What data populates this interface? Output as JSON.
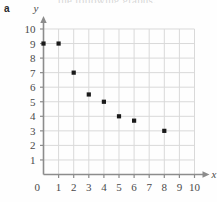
{
  "figure": {
    "part_label": "a",
    "clipped_heading": "the following graphs."
  },
  "chart_data": {
    "type": "scatter",
    "title": "",
    "xlabel": "x",
    "ylabel": "y",
    "xlim": [
      0,
      10
    ],
    "ylim": [
      0,
      10
    ],
    "xticks": [
      1,
      2,
      3,
      4,
      5,
      6,
      7,
      8,
      9,
      10
    ],
    "yticks": [
      1,
      2,
      3,
      4,
      5,
      6,
      7,
      8,
      9,
      10
    ],
    "origin_label": "0",
    "grid": true,
    "legend": null,
    "marker": "square",
    "marker_color": "#1a1a1a",
    "grid_color": "#d9d9d9",
    "axis_color": "#8c8c8c",
    "points": [
      {
        "x": 0,
        "y": 9
      },
      {
        "x": 1,
        "y": 9
      },
      {
        "x": 2,
        "y": 7
      },
      {
        "x": 3,
        "y": 5.5
      },
      {
        "x": 4,
        "y": 5
      },
      {
        "x": 5,
        "y": 4
      },
      {
        "x": 6,
        "y": 3.7
      },
      {
        "x": 8,
        "y": 3
      }
    ]
  }
}
